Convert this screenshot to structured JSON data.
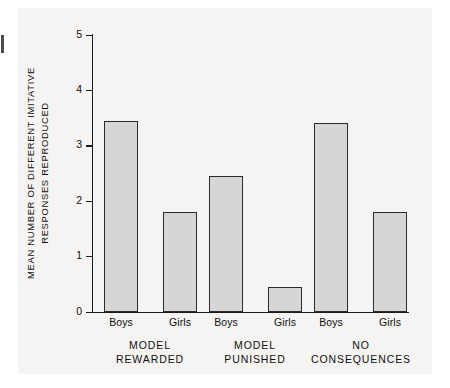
{
  "figure": {
    "background_color": "#f5f4f2",
    "plot_background_color": "#ffffff",
    "bar_fill_color": "#d6d6d6",
    "bar_stroke_color": "#2b2b2b",
    "axis_color": "#1c1c1c"
  },
  "chart_data": {
    "type": "bar",
    "title": "",
    "xlabel": "",
    "ylabel": "MEAN NUMBER OF DIFFERENT IMITATIVE RESPONSES REPRODUCED",
    "ylabel_lines": [
      "MEAN NUMBER OF DIFFERENT IMITATIVE",
      "RESPONSES REPRODUCED"
    ],
    "ylim": [
      0,
      5
    ],
    "ytick_labels": [
      "5",
      "4",
      "3",
      "2",
      "1",
      "0"
    ],
    "yticks": [
      5,
      4,
      3,
      2,
      1,
      0
    ],
    "grid": false,
    "legend": "none",
    "categories": [
      "Boys",
      "Girls",
      "Boys",
      "Girls",
      "Boys",
      "Girls"
    ],
    "values": [
      3.45,
      1.8,
      2.45,
      0.45,
      3.4,
      1.8
    ],
    "groups": [
      {
        "label_lines": [
          "MODEL",
          "REWARDED"
        ],
        "bars": [
          {
            "category": "Boys",
            "value": 3.45
          },
          {
            "category": "Girls",
            "value": 1.8
          }
        ]
      },
      {
        "label_lines": [
          "MODEL",
          "PUNISHED"
        ],
        "bars": [
          {
            "category": "Boys",
            "value": 2.45
          },
          {
            "category": "Girls",
            "value": 0.45
          }
        ]
      },
      {
        "label_lines": [
          "NO",
          "CONSEQUENCES"
        ],
        "bars": [
          {
            "category": "Boys",
            "value": 3.4
          },
          {
            "category": "Girls",
            "value": 1.8
          }
        ]
      }
    ]
  },
  "axis": {
    "y_tick_0": "0",
    "y_tick_1": "1",
    "y_tick_2": "2",
    "y_tick_3": "3",
    "y_tick_4": "4",
    "y_tick_5": "5"
  },
  "x_labels": {
    "b0": "Boys",
    "b1": "Girls",
    "b2": "Boys",
    "b3": "Girls",
    "b4": "Boys",
    "b5": "Girls"
  },
  "group_labels": {
    "g0_l1": "MODEL",
    "g0_l2": "REWARDED",
    "g1_l1": "MODEL",
    "g1_l2": "PUNISHED",
    "g2_l1": "NO",
    "g2_l2": "CONSEQUENCES"
  },
  "ylabel": {
    "line1": "MEAN NUMBER OF DIFFERENT IMITATIVE",
    "line2": "RESPONSES REPRODUCED"
  }
}
